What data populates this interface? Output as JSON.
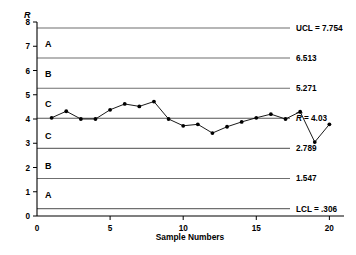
{
  "chart_data": {
    "type": "line",
    "title": "",
    "xlabel": "Sample Numbers",
    "ylabel": "R",
    "xlim": [
      0,
      21
    ],
    "ylim": [
      0,
      8
    ],
    "grid": false,
    "legend": "none",
    "x": [
      1,
      2,
      3,
      4,
      5,
      6,
      7,
      8,
      9,
      10,
      11,
      12,
      13,
      14,
      15,
      16,
      17,
      18,
      19,
      20
    ],
    "values": [
      4.05,
      4.32,
      4.0,
      4.0,
      4.38,
      4.62,
      4.52,
      4.72,
      4.0,
      3.72,
      3.78,
      3.42,
      3.68,
      3.88,
      4.05,
      4.2,
      4.0,
      4.3,
      3.05,
      3.78
    ],
    "series": [
      {
        "name": "Sample Range",
        "values": [
          4.05,
          4.32,
          4.0,
          4.0,
          4.38,
          4.62,
          4.52,
          4.72,
          4.0,
          3.72,
          3.78,
          3.42,
          3.68,
          3.88,
          4.05,
          4.2,
          4.0,
          4.3,
          3.05,
          3.78
        ]
      }
    ],
    "y_ticks": [
      0,
      1,
      2,
      3,
      4,
      5,
      6,
      7,
      8
    ],
    "y_tick_labels": [
      "0",
      "1",
      "2",
      "3",
      "4",
      "5",
      "6",
      "7",
      "8"
    ],
    "x_ticks": [
      0,
      5,
      10,
      15,
      20
    ],
    "x_tick_labels": [
      "0",
      "5",
      "10",
      "15",
      "20"
    ],
    "control_lines": [
      {
        "id": "ucl",
        "value": 7.754,
        "label": "UCL = 7.754",
        "kind": "limit"
      },
      {
        "id": "z2u",
        "value": 6.513,
        "label": "6.513",
        "kind": "zone"
      },
      {
        "id": "z1u",
        "value": 5.271,
        "label": "5.271",
        "kind": "zone"
      },
      {
        "id": "cl",
        "value": 4.03,
        "label": "= 4.03",
        "kind": "center",
        "symbol": "R"
      },
      {
        "id": "z1l",
        "value": 2.789,
        "label": "2.789",
        "kind": "zone"
      },
      {
        "id": "z2l",
        "value": 1.547,
        "label": "1.547",
        "kind": "zone"
      },
      {
        "id": "lcl",
        "value": 0.306,
        "label": "LCL = .306",
        "kind": "limit"
      }
    ],
    "zones": [
      {
        "id": "zone-a-upper",
        "label": "A",
        "value": 7.1
      },
      {
        "id": "zone-b-upper",
        "label": "B",
        "value": 5.85
      },
      {
        "id": "zone-c-upper",
        "label": "C",
        "value": 4.62
      },
      {
        "id": "zone-c-lower",
        "label": "C",
        "value": 3.3
      },
      {
        "id": "zone-b-lower",
        "label": "B",
        "value": 2.05
      },
      {
        "id": "zone-a-lower",
        "label": "A",
        "value": 0.85
      }
    ],
    "colors": {
      "axis": "#000000",
      "zone_line": "#6f6f6f",
      "center_line": "#555555",
      "series": "#000000",
      "background": "#ffffff"
    }
  }
}
